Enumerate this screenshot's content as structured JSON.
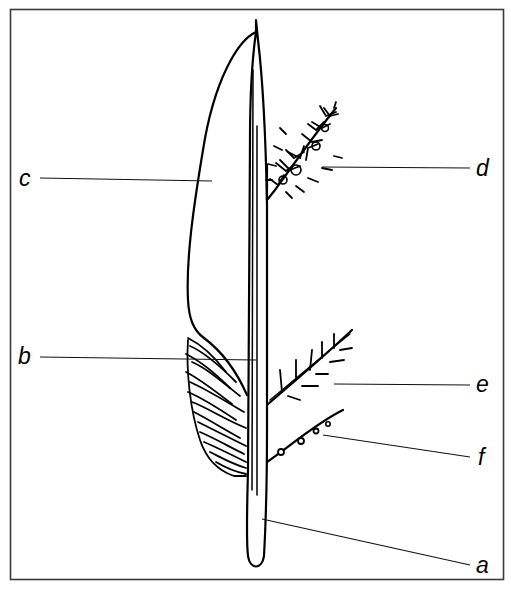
{
  "diagram": {
    "colors": {
      "ink": "#000000",
      "frame": "#3a3a3a",
      "background": "#ffffff"
    },
    "labels": [
      {
        "id": "a",
        "text": "a",
        "side": "right",
        "points_to": "stem base"
      },
      {
        "id": "b",
        "text": "b",
        "side": "left",
        "points_to": "inner axis line"
      },
      {
        "id": "c",
        "text": "c",
        "side": "left",
        "points_to": "leaf blade"
      },
      {
        "id": "d",
        "text": "d",
        "side": "right",
        "points_to": "dense branched tuft"
      },
      {
        "id": "e",
        "text": "e",
        "side": "right",
        "points_to": "barbed side branch"
      },
      {
        "id": "f",
        "text": "f",
        "side": "right",
        "points_to": "beaded side branch"
      }
    ]
  }
}
